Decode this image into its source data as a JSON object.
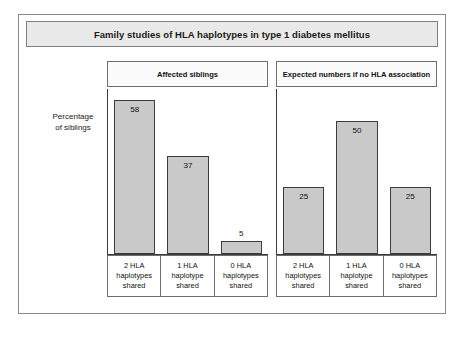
{
  "figure": {
    "title": "Family studies of HLA haplotypes in type 1 diabetes mellitus",
    "ylabel_line1": "Percentage",
    "ylabel_line2": "of siblings"
  },
  "colors": {
    "bar_fill": "#c9c9c9",
    "bar_border": "#3c3c3c",
    "title_bg": "#e9e9e9",
    "frame_border": "#8a8a8a"
  },
  "chart_data": {
    "type": "bar",
    "title": "Family studies of HLA haplotypes in type 1 diabetes mellitus",
    "xlabel": "",
    "ylabel": "Percentage of siblings",
    "ylim": [
      0,
      62
    ],
    "grid": false,
    "legend": "none",
    "categories": [
      "2 HLA\nhaplotypes\nshared",
      "1 HLA\nhaplotype\nshared",
      "0 HLA\nhaplotypes\nshared"
    ],
    "panels": [
      {
        "header": "Affected siblings",
        "values": [
          58,
          37,
          5
        ],
        "categories": [
          "2 HLA\nhaplotypes\nshared",
          "1 HLA\nhaplotype\nshared",
          "0 HLA\nhaplotypes\nshared"
        ]
      },
      {
        "header": "Expected numbers if no HLA association",
        "values": [
          25,
          50,
          25
        ],
        "categories": [
          "2 HLA\nhaplotypes\nshared",
          "1 HLA\nhaplotype\nshared",
          "0 HLA\nhaplotypes\nshared"
        ]
      }
    ]
  }
}
